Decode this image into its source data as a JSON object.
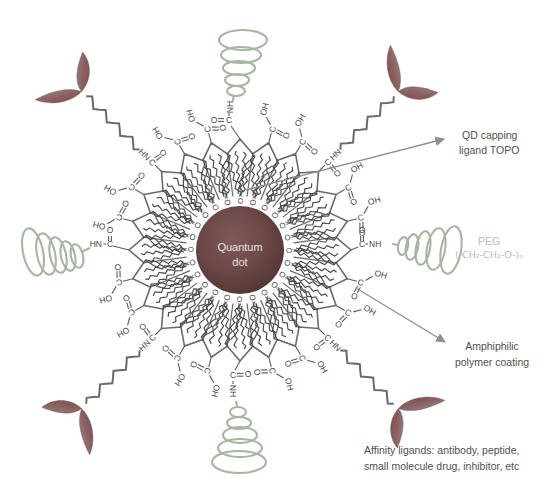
{
  "core": {
    "line1": "Quantum",
    "line2": "dot"
  },
  "annotations": {
    "topo": {
      "line1": "QD capping",
      "line2": "ligand TOPO"
    },
    "peg": {
      "line1": "PEG",
      "line2": "(-CH₂-CH₂-O-)ₙ"
    },
    "amphiphilic": {
      "line1": "Amphiphilic",
      "line2": "polymer coating"
    },
    "affinity": {
      "line1": "Affinity ligands: antibody, peptide,",
      "line2": "small molecule drug, inhibitor, etc"
    }
  },
  "chem": {
    "op": "O=P",
    "c": "C",
    "o": "O",
    "oh": "OH",
    "hn": "HN",
    "nh": "NH"
  },
  "structure": {
    "sectors": 24,
    "center": [
      240,
      250
    ],
    "core_radius": 44,
    "ring_peak_radius": 111,
    "ring_valley_radius": 97,
    "cardinal_attachments": "PEG amide linkages at N, E, S, W",
    "diagonal_attachments": "affinity-ligand zigzag linkers at NE, SE, SW, NW"
  },
  "colors": {
    "line": "#6a6a6a",
    "chain": "#4a4a4a",
    "bond": "#5c5c5c",
    "coil": "#a7b5a2",
    "peg_text": "#b4c0b0",
    "annotation_text": "#4f4f4f",
    "arrow": "#8f8f8f",
    "core_dark": "#523434",
    "core_light": "#7e5a5a",
    "ribbon_dark": "#7b4141",
    "ribbon_light": "#9e9494"
  }
}
